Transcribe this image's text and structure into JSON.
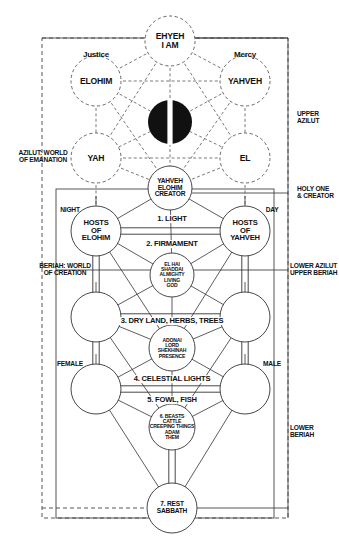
{
  "diagram": {
    "colors": {
      "ink": "#111111",
      "line": "#333333",
      "dashed": "#444444",
      "daat_fill": "#111111",
      "background": "#ffffff"
    }
  },
  "nodes": [
    {
      "id": "keter",
      "label": "EHYEH\nI AM",
      "cx": 170,
      "cy": 41,
      "r": 25,
      "style": "dashed",
      "size": "t9"
    },
    {
      "id": "binah",
      "label": "ELOHIM",
      "cx": 96,
      "cy": 81,
      "r": 25,
      "style": "dashed",
      "size": "t9"
    },
    {
      "id": "hokhmah",
      "label": "YAHVEH",
      "cx": 245,
      "cy": 81,
      "r": 25,
      "style": "dashed",
      "size": "t9"
    },
    {
      "id": "daat",
      "label": "",
      "cx": 170,
      "cy": 122,
      "r": 22,
      "style": "filled",
      "size": "t9"
    },
    {
      "id": "gevurah",
      "label": "YAH",
      "cx": 96,
      "cy": 158,
      "r": 25,
      "style": "dashed",
      "size": "t9"
    },
    {
      "id": "hesed",
      "label": "EL",
      "cx": 245,
      "cy": 158,
      "r": 25,
      "style": "dashed",
      "size": "t9"
    },
    {
      "id": "tiferet1",
      "label": "YAHVEH\nELOHIM\nCREATOR",
      "cx": 170,
      "cy": 188,
      "r": 22,
      "style": "solid",
      "size": "t7"
    },
    {
      "id": "hod",
      "label": "HOSTS\nOF\nELOHIM",
      "cx": 96,
      "cy": 231,
      "r": 25,
      "style": "solid",
      "size": "t8"
    },
    {
      "id": "netzah",
      "label": "HOSTS\nOF\nYAHVEH",
      "cx": 245,
      "cy": 231,
      "r": 25,
      "style": "solid",
      "size": "t8"
    },
    {
      "id": "yesod1",
      "label": "EL HAI\nSHADDAI\nALMIGHTY\nLIVING\nGOD",
      "cx": 172,
      "cy": 275,
      "r": 22,
      "style": "solid",
      "size": "t55"
    },
    {
      "id": "left2",
      "label": "",
      "cx": 96,
      "cy": 317,
      "r": 25,
      "style": "solid",
      "size": "t8"
    },
    {
      "id": "right2",
      "label": "",
      "cx": 245,
      "cy": 317,
      "r": 25,
      "style": "solid",
      "size": "t8"
    },
    {
      "id": "malkhut1",
      "label": "ADONAI\nLORD\nSHEKHINAH\nPRESENCE",
      "cx": 172,
      "cy": 348,
      "r": 23,
      "style": "solid",
      "size": "t55"
    },
    {
      "id": "left3",
      "label": "",
      "cx": 96,
      "cy": 389,
      "r": 25,
      "style": "solid",
      "size": "t8"
    },
    {
      "id": "right3",
      "label": "",
      "cx": 245,
      "cy": 389,
      "r": 25,
      "style": "solid",
      "size": "t8"
    },
    {
      "id": "beasts",
      "label": "6. BEASTS\nCATTLE\nCREEPING THINGS\nADAM\nTHEM",
      "cx": 172,
      "cy": 427,
      "r": 23,
      "style": "solid",
      "size": "t55"
    },
    {
      "id": "rest",
      "label": "7. REST\nSABBATH",
      "cx": 172,
      "cy": 508,
      "r": 25,
      "style": "solid",
      "size": "t7"
    }
  ],
  "path_labels": [
    {
      "id": "light",
      "text": "1. LIGHT",
      "x": 172,
      "y": 219,
      "size": "t8"
    },
    {
      "id": "firmament",
      "text": "2. FIRMAMENT",
      "x": 172,
      "y": 244,
      "size": "t8"
    },
    {
      "id": "dryland",
      "text": "3. DRY LAND, HERBS, TREES",
      "x": 172,
      "y": 321,
      "size": "t8"
    },
    {
      "id": "celestial",
      "text": "4. CELESTIAL LIGHTS",
      "x": 172,
      "y": 379,
      "size": "t8"
    },
    {
      "id": "fowlfish",
      "text": "5. FOWL, FISH",
      "x": 172,
      "y": 400,
      "size": "t8"
    }
  ],
  "side_labels": [
    {
      "id": "justice",
      "text": "Justice",
      "x": 96,
      "y": 55,
      "size": "mixed",
      "align": "center"
    },
    {
      "id": "mercy",
      "text": "Mercy",
      "x": 245,
      "y": 55,
      "size": "mixed",
      "align": "center"
    },
    {
      "id": "upper-azilut",
      "text": "UPPER\nAZILUT",
      "x": 305,
      "y": 118,
      "size": "t7",
      "align": "left"
    },
    {
      "id": "azilut-emanation",
      "text": "AZILUT: WORLD\nOF EMANATION",
      "x": 43,
      "y": 157,
      "size": "t7",
      "align": "center"
    },
    {
      "id": "holy-one-creator",
      "text": "HOLY ONE\n& CREATOR",
      "x": 305,
      "y": 193,
      "size": "t7",
      "align": "left"
    },
    {
      "id": "night",
      "text": "NIGHT",
      "x": 70,
      "y": 210,
      "size": "t7",
      "align": "center"
    },
    {
      "id": "day",
      "text": "DAY",
      "x": 272,
      "y": 210,
      "size": "t7",
      "align": "center"
    },
    {
      "id": "beriah-creation",
      "text": "BERIAH: WORLD\nOF CREATION",
      "x": 65,
      "y": 270,
      "size": "t7",
      "align": "center"
    },
    {
      "id": "lower-azilut-upper",
      "text": "LOWER AZILUT\nUPPER BERIAH",
      "x": 298,
      "y": 270,
      "size": "t7",
      "align": "left"
    },
    {
      "id": "female",
      "text": "FEMALE",
      "x": 70,
      "y": 364,
      "size": "t7",
      "align": "center"
    },
    {
      "id": "male",
      "text": "MALE",
      "x": 272,
      "y": 364,
      "size": "t7",
      "align": "center"
    },
    {
      "id": "lower-beriah",
      "text": "LOWER\nBERIAH",
      "x": 298,
      "y": 432,
      "size": "t7",
      "align": "left"
    }
  ],
  "frames": [
    {
      "id": "azilut-frame",
      "x": 42,
      "y": 38,
      "w": 246,
      "h": 480,
      "style": "dashed"
    },
    {
      "id": "beriah-frame",
      "x": 56,
      "y": 189,
      "w": 218,
      "h": 329,
      "style": "solid"
    },
    {
      "id": "upper-rule",
      "x1": 42,
      "y1": 38,
      "x2": 288,
      "y2": 38,
      "style": "mixed"
    }
  ]
}
